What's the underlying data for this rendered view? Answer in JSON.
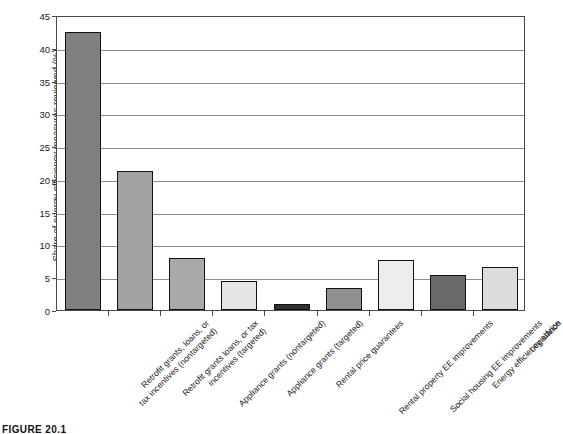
{
  "caption": "FIGURE 20.1",
  "chart_data": {
    "type": "bar",
    "title": "",
    "xlabel": "",
    "ylabel": "Share of energy efficiency measures reviewed (%)",
    "ylim": [
      0,
      45
    ],
    "ytick_step": 5,
    "yticks": [
      "0",
      "5",
      "10",
      "15",
      "20",
      "25",
      "30",
      "35",
      "40",
      "45"
    ],
    "grid": "horizontal",
    "legend": "none",
    "categories": [
      "Retrofit grants, loans, or tax incentives (nontargeted)",
      "Retrofit grants loans, or tax incentives (targeted)",
      "Appliance grants (nontargeted)",
      "Appliance grants (targeted)",
      "Rental price guarantees",
      "Rental property EE improvements",
      "Social housing EE improvements",
      "Energy efficiency advice",
      "Legislation"
    ],
    "category_lines": [
      [
        "Retrofit grants, loans, or",
        "tax incentives (nontargeted)"
      ],
      [
        "Retrofit grants loans, or tax",
        "incentives (targeted)"
      ],
      [
        "Appliance grants (nontargeted)"
      ],
      [
        "Appliance grants (targeted)"
      ],
      [
        "Rental price guarantees"
      ],
      [
        "Rental property EE improvements"
      ],
      [
        "Social housing EE improvements"
      ],
      [
        "Energy efficiency advice"
      ],
      [
        "Legislation"
      ]
    ],
    "values": [
      42.4,
      21.2,
      7.9,
      4.5,
      0.9,
      3.3,
      7.7,
      5.4,
      6.5
    ],
    "colors": [
      "#808080",
      "#a2a2a2",
      "#a9a9a9",
      "#e5e5e5",
      "#2f2f2f",
      "#909090",
      "#ededed",
      "#6a6a6a",
      "#dddddd"
    ],
    "bar_edge_color": "#111111",
    "gridline_color": "#8d8d8d",
    "axis_color": "#4a4a4a"
  }
}
